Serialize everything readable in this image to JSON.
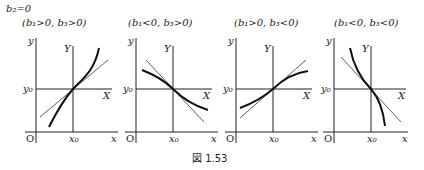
{
  "figure": {
    "top_condition": "b₂=0",
    "caption": "図 1.53",
    "axis_labels": {
      "y": "y",
      "x": "x",
      "Y": "Y",
      "X": "X",
      "origin": "O",
      "y0": "y₀",
      "x0": "x₀"
    },
    "panels": [
      {
        "condition": "(b₁>0, b₃>0)",
        "curve": "increasing, convex above tangent for x>x₀ (cubic, steepening)"
      },
      {
        "condition": "(b₁<0, b₃>0)",
        "curve": "decreasing, flattening away from x₀"
      },
      {
        "condition": "(b₁>0, b₃<0)",
        "curve": "increasing, flattening away from x₀"
      },
      {
        "condition": "(b₁<0, b₃<0)",
        "curve": "decreasing, steepening away from x₀"
      }
    ]
  }
}
